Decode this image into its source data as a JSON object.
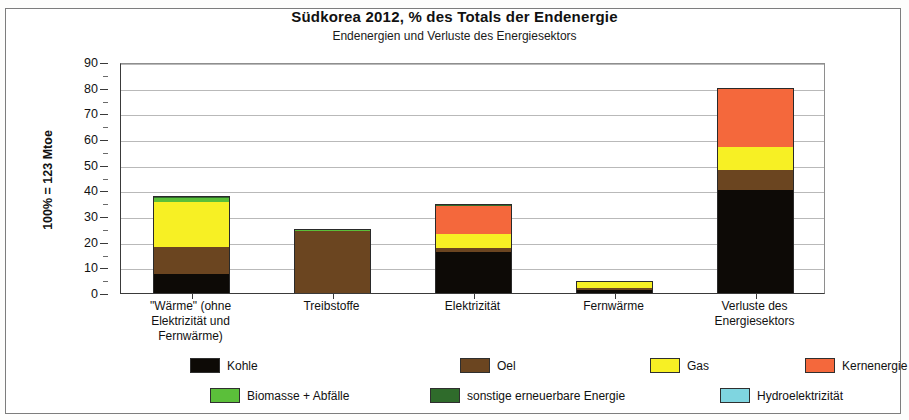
{
  "chart_data": {
    "type": "bar",
    "stacked": true,
    "title": "Südkorea  2012, % des Totals der Endenergie",
    "subtitle": "Endenergien und Verluste des Energiesektors",
    "xlabel": "",
    "ylabel": "100% = 123 Mtoe",
    "ylim": [
      0,
      90
    ],
    "yticks": [
      0,
      10,
      20,
      30,
      40,
      50,
      60,
      70,
      80,
      90
    ],
    "ytick_labels": [
      "0",
      "10",
      "20",
      "30",
      "40",
      "50",
      "60",
      "70",
      "80",
      "90"
    ],
    "grid": true,
    "legend_position": "bottom",
    "categories": [
      "\"Wärme\" (ohne\nElektrizität und\nFernwärme)",
      "Treibstoffe",
      "Elektrizität",
      "Fernwärme",
      "Verluste des\nEnergiesektors"
    ],
    "category_lines": [
      [
        "\"Wärme\" (ohne",
        "Elektrizität und",
        "Fernwärme)"
      ],
      [
        "Treibstoffe"
      ],
      [
        "Elektrizität"
      ],
      [
        "Fernwärme"
      ],
      [
        "Verluste des",
        "Energiesektors"
      ]
    ],
    "series": [
      {
        "name": "Kohle",
        "color": "#0d0a06",
        "values": [
          7.5,
          0.0,
          16.0,
          1.2,
          40.0
        ]
      },
      {
        "name": "Oel",
        "color": "#6b4520",
        "values": [
          10.5,
          24.3,
          1.5,
          0.9,
          8.0
        ]
      },
      {
        "name": "Gas",
        "color": "#f7f024",
        "values": [
          17.5,
          0.0,
          5.5,
          2.4,
          9.0
        ]
      },
      {
        "name": "Kernenergie",
        "color": "#f4683c",
        "values": [
          0.0,
          0.0,
          11.0,
          0.0,
          23.0
        ]
      },
      {
        "name": "Biomasse + Abfälle",
        "color": "#5bbf3a",
        "values": [
          1.6,
          0.4,
          0.0,
          0.0,
          0.0
        ]
      },
      {
        "name": "sonstige erneuerbare Energie",
        "color": "#2f6b2b",
        "values": [
          0.6,
          0.0,
          0.3,
          0.0,
          0.0
        ]
      },
      {
        "name": "Hydroelektrizität",
        "color": "#7fd5e0",
        "values": [
          0.0,
          0.0,
          0.2,
          0.0,
          0.0
        ]
      }
    ],
    "totals": [
      38.0,
      24.7,
      34.5,
      4.5,
      80.0
    ]
  },
  "legend": {
    "row1": [
      {
        "label": "Kohle",
        "color": "#0d0a06"
      },
      {
        "label": "Oel",
        "color": "#6b4520"
      },
      {
        "label": "Gas",
        "color": "#f7f024"
      },
      {
        "label": "Kernenergie",
        "color": "#f4683c"
      }
    ],
    "row2": [
      {
        "label": "Biomasse + Abfälle",
        "color": "#5bbf3a"
      },
      {
        "label": "sonstige erneuerbare Energie",
        "color": "#2f6b2b"
      },
      {
        "label": "Hydroelektrizität",
        "color": "#7fd5e0"
      }
    ]
  }
}
